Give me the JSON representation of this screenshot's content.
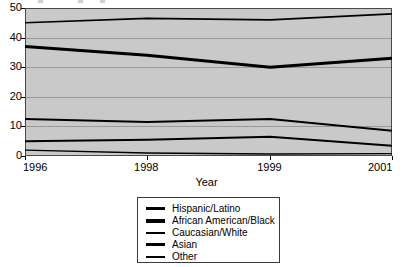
{
  "chart_data": {
    "type": "line",
    "title": "",
    "xlabel": "Year",
    "ylabel": "",
    "grid": true,
    "legend_position": "bottom",
    "x": [
      1996,
      1998,
      1999,
      2001
    ],
    "x_tick_labels": [
      "1996",
      "1998",
      "1999",
      "2001"
    ],
    "y_tick_labels": [
      "0",
      "10",
      "20",
      "30",
      "40",
      "50"
    ],
    "y_ticks": [
      0,
      10,
      20,
      30,
      40,
      50
    ],
    "ylim": [
      0,
      50
    ],
    "xlim": [
      1996,
      2001
    ],
    "series": [
      {
        "name": "Hispanic/Latino",
        "values": [
          12.5,
          11.5,
          12.5,
          8.5
        ],
        "color": "#000000",
        "width": 2.0
      },
      {
        "name": "African American/Black",
        "values": [
          37,
          34,
          30,
          33
        ],
        "color": "#000000",
        "width": 3.0
      },
      {
        "name": "Caucasian/White",
        "values": [
          45,
          46.5,
          46,
          48
        ],
        "color": "#000000",
        "width": 1.6
      },
      {
        "name": "Asian",
        "values": [
          5,
          5.5,
          6.5,
          3.5
        ],
        "color": "#000000",
        "width": 2.0
      },
      {
        "name": "Other",
        "values": [
          2,
          1,
          0.7,
          0.8
        ],
        "color": "#000000",
        "width": 1.4
      }
    ]
  },
  "legend": {
    "entries": [
      {
        "label": "Hispanic/Latino",
        "thickness": "3px"
      },
      {
        "label": "African American/Black",
        "thickness": "4px"
      },
      {
        "label": "Caucasian/White",
        "thickness": "2px"
      },
      {
        "label": "Asian",
        "thickness": "3px"
      },
      {
        "label": "Other",
        "thickness": "2px"
      }
    ]
  },
  "axes": {
    "x_title": "Year"
  },
  "colors": {
    "plot_background": "#c9c9c9",
    "gridline": "#9a9a9a",
    "axis": "#000000",
    "line": "#000000",
    "page_background": "#ffffff"
  }
}
